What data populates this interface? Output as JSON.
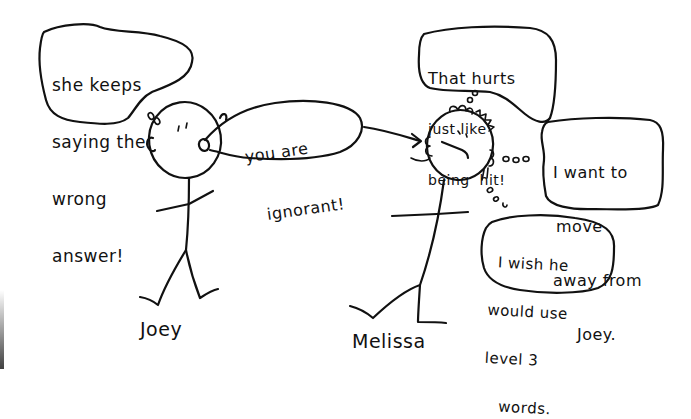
{
  "scene": {
    "description": "Hand-drawn stick figure cartoon about hurtful words",
    "colors": {
      "background": "#ffffff",
      "ink": "#111111"
    }
  },
  "characters": [
    {
      "name": "Joey",
      "expression": "smug",
      "thought": {
        "type": "thought-bubble",
        "lines": [
          "she keeps",
          "saying the",
          "wrong",
          "answer!"
        ]
      },
      "speech": {
        "type": "speech-bubble",
        "lines": [
          "you are",
          "ignorant!"
        ]
      }
    },
    {
      "name": "Melissa",
      "expression": "frowning",
      "thoughts": [
        {
          "type": "thought-bubble",
          "lines": [
            "That hurts",
            "just like",
            "being  hit!"
          ]
        },
        {
          "type": "thought-bubble",
          "lines": [
            "I want to",
            "move",
            "away from",
            "Joey."
          ]
        },
        {
          "type": "thought-bubble",
          "lines": [
            "I wish he",
            "would use",
            "level 3",
            "words."
          ]
        }
      ]
    }
  ],
  "arrow": {
    "from": "Joey speech bubble",
    "to": "Melissa ear"
  }
}
